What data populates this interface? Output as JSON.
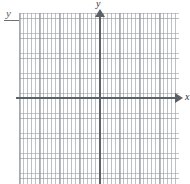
{
  "figure": {
    "kind": "blank-coordinate-plane",
    "width": 190,
    "height": 184,
    "background_color": "#ffffff"
  },
  "header": {
    "label": "y",
    "rule_color": "#6b7076"
  },
  "axes": {
    "color": "#5c6067",
    "x": {
      "label": "x",
      "arrow": "right-arrowhead",
      "origin_px": 100,
      "y_px": 98
    },
    "y": {
      "label": "y",
      "arrow": "up-arrowhead",
      "origin_px": 98,
      "x_px": 100
    }
  },
  "grid": {
    "minor_dot_spacing_px": 4,
    "major_line_spacing_px": 20,
    "minor_color": "#a4a9b0",
    "major_color": "#929798",
    "left_px": 19,
    "top_px": 13,
    "width_px": 160,
    "height_px": 171
  },
  "chart_data": {
    "type": "scatter",
    "title": "",
    "xlabel": "x",
    "ylabel": "y",
    "series": [
      {
        "name": "",
        "x": [],
        "y": []
      }
    ],
    "xlim": [
      -20,
      20
    ],
    "ylim": [
      -17,
      21
    ],
    "grid": true,
    "legend": "none",
    "annotations": []
  }
}
